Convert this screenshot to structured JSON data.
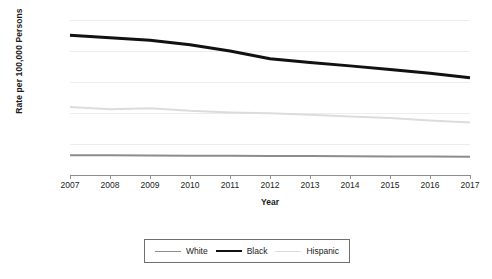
{
  "chart_data": {
    "type": "line",
    "title": "",
    "xlabel": "Year",
    "ylabel": "Rate per 100,000 Persons",
    "x": [
      2007,
      2008,
      2009,
      2010,
      2011,
      2012,
      2013,
      2014,
      2015,
      2016,
      2017
    ],
    "xtick_labels": [
      "2007",
      "2008",
      "2009",
      "2010",
      "2011",
      "2012",
      "2013",
      "2014",
      "2015",
      "2016",
      "2017"
    ],
    "ytick_labels": [
      "0",
      "500",
      "1,000",
      "1,500",
      "2,000",
      "2,500"
    ],
    "yticks": [
      0,
      500,
      1000,
      1500,
      2000,
      2500
    ],
    "ylim": [
      0,
      2500
    ],
    "xlim": [
      2007,
      2017
    ],
    "grid": true,
    "legend_position": "bottom-center",
    "series": [
      {
        "name": "White",
        "color": "#8c8c8c",
        "width": 2.0,
        "values": [
          320,
          318,
          315,
          312,
          310,
          308,
          305,
          302,
          300,
          298,
          296
        ]
      },
      {
        "name": "Black",
        "color": "#111111",
        "width": 3.0,
        "values": [
          2255,
          2215,
          2175,
          2100,
          2000,
          1875,
          1815,
          1760,
          1700,
          1640,
          1570
        ]
      },
      {
        "name": "Hispanic",
        "color": "#dcdcdc",
        "width": 2.0,
        "values": [
          1095,
          1060,
          1075,
          1035,
          1010,
          995,
          970,
          945,
          920,
          880,
          845
        ]
      }
    ]
  },
  "legend": {
    "items": [
      {
        "label": "White"
      },
      {
        "label": "Black"
      },
      {
        "label": "Hispanic"
      }
    ]
  }
}
